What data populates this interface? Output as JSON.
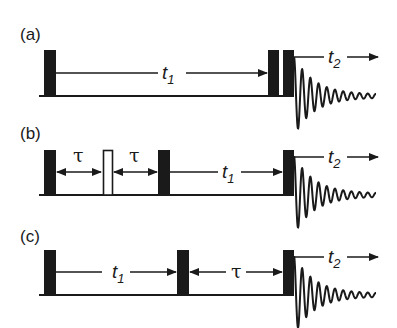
{
  "figure": {
    "panels": [
      {
        "label": "(a)",
        "pulses": [
          "filled",
          "filled",
          "filled"
        ],
        "delays": [
          {
            "symbol": "t",
            "sub": "1"
          }
        ],
        "acquisition": {
          "symbol": "t",
          "sub": "2"
        }
      },
      {
        "label": "(b)",
        "pulses": [
          "filled",
          "open",
          "filled",
          "filled"
        ],
        "delays": [
          {
            "symbol": "τ"
          },
          {
            "symbol": "τ"
          },
          {
            "symbol": "t",
            "sub": "1"
          }
        ],
        "acquisition": {
          "symbol": "t",
          "sub": "2"
        }
      },
      {
        "label": "(c)",
        "pulses": [
          "filled",
          "filled",
          "filled"
        ],
        "delays": [
          {
            "symbol": "t",
            "sub": "1"
          },
          {
            "symbol": "τ"
          }
        ],
        "acquisition": {
          "symbol": "t",
          "sub": "2"
        }
      }
    ]
  },
  "a": {
    "label": "(a)",
    "t1": "t",
    "t1_sub": "1",
    "t2": "t",
    "t2_sub": "2"
  },
  "b": {
    "label": "(b)",
    "tau1": "τ",
    "tau2": "τ",
    "t1": "t",
    "t1_sub": "1",
    "t2": "t",
    "t2_sub": "2"
  },
  "c": {
    "label": "(c)",
    "t1": "t",
    "t1_sub": "1",
    "tau": "τ",
    "t2": "t",
    "t2_sub": "2"
  },
  "colors": {
    "ink": "#1a1a1a",
    "background": "#ffffff"
  }
}
